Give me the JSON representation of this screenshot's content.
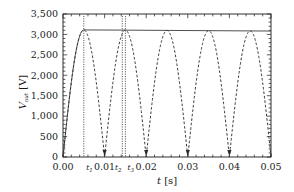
{
  "chart_data": {
    "type": "line",
    "title": "",
    "xlabel": "t [s]",
    "ylabel": "V_out [V]",
    "xlim": [
      0.0,
      0.05
    ],
    "ylim": [
      0,
      3500
    ],
    "xticks": [
      0.0,
      0.01,
      0.02,
      0.03,
      0.04,
      0.05
    ],
    "xtick_labels": [
      "0.00",
      "0.01",
      "0.02",
      "0.03",
      "0.04",
      "0.05"
    ],
    "yticks": [
      0,
      500,
      1000,
      1500,
      2000,
      2500,
      3000,
      3500
    ],
    "ytick_labels": [
      "0",
      "500",
      "1,000",
      "1,500",
      "2,000",
      "2,500",
      "3,000",
      "3,500"
    ],
    "xminor_step": 0.002,
    "yminor_step": 100,
    "grid": false,
    "legend": false,
    "frame": "box-all-sides-ticks",
    "series": [
      {
        "name": "rectified_sine",
        "style": "dashed",
        "color": "#2b2b2b",
        "description": "Full-wave rectified sine, half-period 0.01 s",
        "amplitude": 3110,
        "half_period": 0.01,
        "peaks_x": [
          0.005,
          0.015,
          0.025,
          0.035,
          0.045
        ],
        "peaks_y": [
          3110,
          3105,
          3098,
          3092,
          3086
        ],
        "zeros_x": [
          0.0,
          0.01,
          0.02,
          0.03,
          0.04,
          0.05
        ]
      },
      {
        "name": "envelope",
        "style": "solid",
        "color": "#444444",
        "description": "Capacitor output envelope rising on first quarter cycle then slowly decaying",
        "points": [
          {
            "x": 0.0,
            "y": 0
          },
          {
            "x": 0.005,
            "y": 3110
          },
          {
            "x": 0.015,
            "y": 3105
          },
          {
            "x": 0.025,
            "y": 3098
          },
          {
            "x": 0.035,
            "y": 3092
          },
          {
            "x": 0.045,
            "y": 3086
          },
          {
            "x": 0.05,
            "y": 3083
          }
        ]
      }
    ],
    "annotations": [
      {
        "name": "t1",
        "label": "t",
        "subscript": "1",
        "x": 0.005,
        "marker": "dotted-vertical",
        "label_x": 0.0056,
        "label_y": 170
      },
      {
        "name": "t2",
        "label": "t",
        "subscript": "2",
        "x": 0.01425,
        "marker": "dotted-vertical",
        "label_x": 0.0125,
        "label_y": 170
      },
      {
        "name": "t3",
        "label": "t",
        "subscript": "3",
        "x": 0.015,
        "marker": "dotted-vertical",
        "label_x": 0.0155,
        "label_y": 170
      }
    ]
  },
  "axis": {
    "x_title_var": "t",
    "x_title_unit": "[s]",
    "y_title_var": "V",
    "y_title_sub": "out",
    "y_title_unit": "[V]"
  }
}
